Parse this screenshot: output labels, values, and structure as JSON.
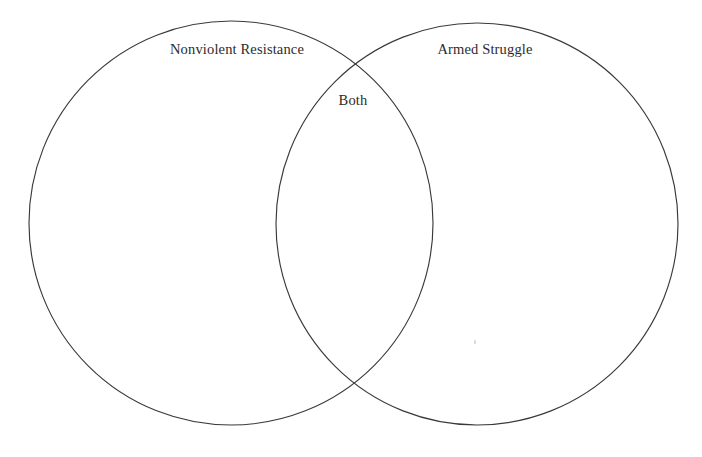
{
  "diagram": {
    "type": "venn-two-set",
    "title": "",
    "background_color": "#ffffff",
    "stroke_color": "#3a3a3a",
    "stroke_width": 1.15,
    "fill": "none",
    "text_color": "#2b2b2b",
    "sets": [
      {
        "id": "left",
        "label": "Nonviolent Resistance",
        "label_x": 237,
        "label_y": 49,
        "center_x": 231,
        "center_y": 223,
        "radius": 202,
        "items": []
      },
      {
        "id": "right",
        "label": "Armed Struggle",
        "label_x": 485,
        "label_y": 49,
        "center_x": 477,
        "center_y": 224,
        "radius": 201,
        "items": []
      }
    ],
    "intersection": {
      "id": "both",
      "label": "Both",
      "label_x": 353,
      "label_y": 100,
      "items": []
    },
    "intersection_points": [
      {
        "x": 355,
        "y": 64
      },
      {
        "x": 355,
        "y": 385
      }
    ],
    "artifacts": [
      {
        "name": "scan-speck",
        "x": 474,
        "y": 340
      }
    ]
  }
}
